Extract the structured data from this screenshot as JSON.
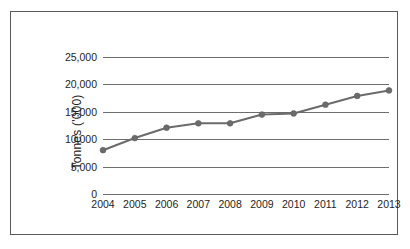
{
  "chart_data": {
    "type": "line",
    "title": "",
    "xlabel": "",
    "ylabel": "Tonnes ('000)",
    "categories": [
      "2004",
      "2005",
      "2006",
      "2007",
      "2008",
      "2009",
      "2010",
      "2011",
      "2012",
      "2013"
    ],
    "values": [
      8000,
      10200,
      12100,
      12900,
      12900,
      14500,
      14700,
      16300,
      17900,
      18900
    ],
    "series": [
      {
        "name": "Tonnes",
        "values": [
          8000,
          10200,
          12100,
          12900,
          12900,
          14500,
          14700,
          16300,
          17900,
          18900
        ]
      }
    ],
    "ylim": [
      0,
      25000
    ],
    "yticks": [
      0,
      5000,
      10000,
      15000,
      20000,
      25000
    ],
    "ytick_labels": [
      "0",
      "5,000",
      "10,000",
      "15,000",
      "20,000",
      "25,000"
    ],
    "grid": true,
    "legend": "none",
    "marker": "circle",
    "line_color": "#6b6b6b",
    "marker_color": "#6b6b6b",
    "grid_color": "#6e6e6e",
    "border_color": "#5a5a5a",
    "background": "#ffffff"
  },
  "axis": {
    "y_title": "Tonnes ('000)",
    "y_ticks": [
      "25,000",
      "20,000",
      "15,000",
      "10,000",
      "5,000",
      "0"
    ],
    "x_ticks": [
      "2004",
      "2005",
      "2006",
      "2007",
      "2008",
      "2009",
      "2010",
      "2011",
      "2012",
      "2013"
    ]
  }
}
